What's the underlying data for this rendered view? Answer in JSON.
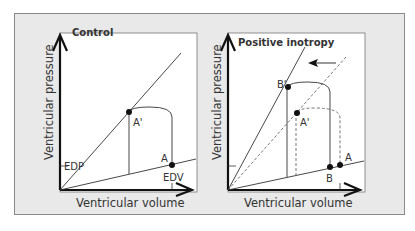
{
  "panels": [
    {
      "title": "Control",
      "xlabel": "Ventricular volume",
      "ylabel": "Ventricular pressure",
      "labels": {
        "edp": "EDP",
        "edv": "EDV",
        "a": "A",
        "a_prime": "A'"
      }
    },
    {
      "title": "Positive inotropy",
      "xlabel": "Ventricular volume",
      "ylabel": "Ventricular pressure",
      "labels": {
        "b_prime": "B'",
        "a_prime": "A'",
        "a": "A",
        "b": "B"
      }
    }
  ],
  "colors": {
    "background": "#e9e9e9",
    "panel": "#ffffff",
    "line": "#333333",
    "axis": "#111111"
  }
}
